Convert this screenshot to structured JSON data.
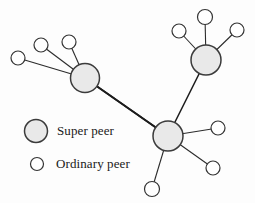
{
  "figure": {
    "kind": "super-peer-network-diagram",
    "background_color": "#fdfdfd",
    "width": 255,
    "height": 203
  },
  "style": {
    "super_peer_fill": "#e9e9e9",
    "super_peer_stroke": "#3b3b3b",
    "ordinary_peer_fill": "#ffffff",
    "ordinary_peer_stroke": "#333333",
    "edge_color": "#2b2b2b",
    "backbone_color": "#1c1c1c",
    "text_color": "#1a1a1a"
  },
  "legend": {
    "items": [
      {
        "key": "super-peer",
        "label": "Super peer",
        "marker": "filled-gray-circle",
        "marker_cx": 36,
        "marker_cy": 131,
        "marker_r": 11.5
      },
      {
        "key": "ordinary-peer",
        "label": "Ordinary peer",
        "marker": "hollow-circle",
        "marker_cx": 37,
        "marker_cy": 164,
        "marker_r": 6.5
      }
    ]
  },
  "graph": {
    "super_peers": [
      {
        "id": "sp-left",
        "cx": 85,
        "cy": 78,
        "r": 14.5
      },
      {
        "id": "sp-top-right",
        "cx": 206,
        "cy": 60,
        "r": 15.0
      },
      {
        "id": "sp-bottom",
        "cx": 168,
        "cy": 136,
        "r": 15.0
      }
    ],
    "ordinary_peers": [
      {
        "id": "op-l1",
        "cx": 18,
        "cy": 58,
        "r": 7.0,
        "parent": "sp-left"
      },
      {
        "id": "op-l2",
        "cx": 41,
        "cy": 45,
        "r": 7.0,
        "parent": "sp-left"
      },
      {
        "id": "op-l3",
        "cx": 69,
        "cy": 42,
        "r": 7.0,
        "parent": "sp-left"
      },
      {
        "id": "op-t1",
        "cx": 179,
        "cy": 31,
        "r": 7.0,
        "parent": "sp-top-right"
      },
      {
        "id": "op-t2",
        "cx": 205,
        "cy": 17,
        "r": 7.5,
        "parent": "sp-top-right"
      },
      {
        "id": "op-t3",
        "cx": 237,
        "cy": 30,
        "r": 7.0,
        "parent": "sp-top-right"
      },
      {
        "id": "op-b1",
        "cx": 218,
        "cy": 128,
        "r": 7.0,
        "parent": "sp-bottom"
      },
      {
        "id": "op-b2",
        "cx": 213,
        "cy": 168,
        "r": 7.0,
        "parent": "sp-bottom"
      },
      {
        "id": "op-b3",
        "cx": 152,
        "cy": 189,
        "r": 7.5,
        "parent": "sp-bottom"
      }
    ],
    "backbone_edges": [
      {
        "from": "sp-left",
        "to": "sp-top-right"
      },
      {
        "from": "sp-top-right",
        "to": "sp-bottom"
      },
      {
        "from": "sp-bottom",
        "to": "sp-left"
      }
    ]
  }
}
